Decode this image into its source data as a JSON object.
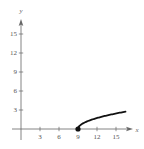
{
  "chart_data": {
    "type": "line",
    "title": "",
    "xlabel": "x",
    "ylabel": "y",
    "function": "y = sqrt(x - 9)",
    "xlim": [
      -1,
      17.5
    ],
    "ylim": [
      -1,
      17.5
    ],
    "grid": false,
    "legend": null,
    "x_ticks": [
      3,
      6,
      9,
      12,
      15
    ],
    "y_ticks": [
      3,
      6,
      9,
      12,
      15
    ],
    "x_tick_labels": [
      "3",
      "6",
      "9",
      "12",
      "15"
    ],
    "y_tick_labels": [
      "3",
      "6",
      "9",
      "12",
      "15"
    ],
    "series": [
      {
        "name": "curve",
        "x": [
          9,
          9.25,
          9.5,
          10,
          10.5,
          11,
          12,
          13,
          14,
          15,
          16,
          16.5
        ],
        "y": [
          0,
          0.5,
          0.71,
          1,
          1.22,
          1.41,
          1.73,
          2,
          2.24,
          2.45,
          2.65,
          2.74
        ]
      }
    ],
    "annotations": [
      {
        "type": "closed-point",
        "x": 9,
        "y": 0
      }
    ],
    "colors": {
      "curve": "#111111",
      "axes": "#666666"
    }
  }
}
